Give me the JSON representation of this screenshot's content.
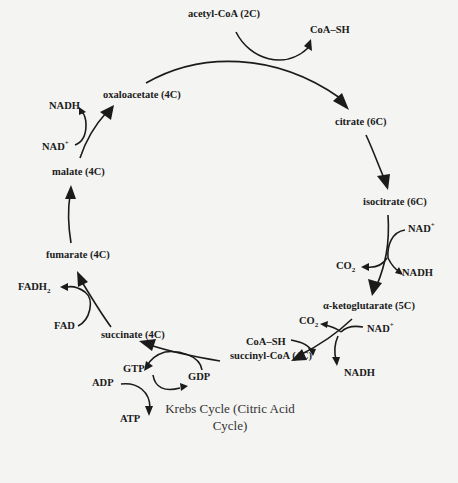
{
  "diagram": {
    "title_line1": "Krebs Cycle (Citric Acid",
    "title_line2": "Cycle)",
    "metabolites": {
      "acetyl_coa": "acetyl-CoA (2C)",
      "oxaloacetate": "oxaloacetate (4C)",
      "citrate": "citrate (6C)",
      "isocitrate": "isocitrate (6C)",
      "alpha_ketoglutarate": "α-ketoglutarate (5C)",
      "succinyl_coa": "succinyl-CoA (4C)",
      "succinate": "succinate (4C)",
      "fumarate": "fumarate (4C)",
      "malate": "malate (4C)"
    },
    "cofactors": {
      "citrate_step": {
        "coa_sh_out": "CoA–SH"
      },
      "isocitrate_step": {
        "nad_in": "NAD",
        "nad_charge": "+",
        "co2_out": "CO",
        "co2_sub": "2",
        "nadh_out": "NADH"
      },
      "akg_step": {
        "nad_in": "NAD",
        "nad_charge": "+",
        "co2_out": "CO",
        "co2_sub": "2",
        "coa_sh_in": "CoA–SH",
        "nadh_out": "NADH"
      },
      "succinyl_step": {
        "gdp_in": "GDP",
        "gtp_out": "GTP",
        "adp_in": "ADP",
        "atp_out": "ATP"
      },
      "succinate_step": {
        "fad_in": "FAD",
        "fadh2_out": "FADH",
        "fadh2_sub": "2"
      },
      "malate_step": {
        "nad_in": "NAD",
        "nad_charge": "+",
        "nadh_out": "NADH"
      }
    },
    "colors": {
      "background": "#f4f4f2",
      "ink": "#1b1b1b",
      "title": "#333333"
    }
  }
}
